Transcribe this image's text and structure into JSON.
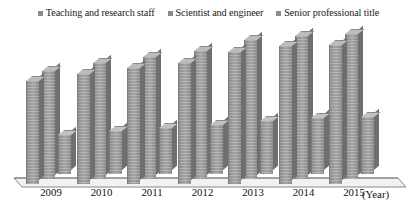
{
  "chart_data": {
    "type": "bar",
    "title": "",
    "subtitle": "",
    "xlabel": "(Year)",
    "ylabel": "",
    "categories": [
      "2009",
      "2010",
      "2011",
      "2012",
      "2013",
      "2014",
      "2015"
    ],
    "series": [
      {
        "name": "Teaching and research staff",
        "color": "#a6a6a6",
        "values": [
          112,
          120,
          126,
          132,
          144,
          150,
          152
        ]
      },
      {
        "name": "Scientist and engineer",
        "color": "#a6a6a6",
        "values": [
          118,
          126,
          133,
          139,
          151,
          156,
          158
        ]
      },
      {
        "name": "Senior professional title",
        "color": "#b3b3b3",
        "values": [
          42,
          47,
          50,
          53,
          58,
          61,
          62
        ]
      }
    ],
    "ylim": [
      0,
      170
    ],
    "grid": false,
    "legend_position": "top",
    "style": "3d-clustered-column"
  },
  "legend": {
    "items": [
      {
        "label": "Teaching and research staff",
        "swatch_color": "#8c8c8c"
      },
      {
        "label": "Scientist and engineer",
        "swatch_color": "#8c8c8c"
      },
      {
        "label": "Senior professional title",
        "swatch_color": "#8c8c8c"
      }
    ]
  },
  "axis": {
    "unit_label": "(Year)",
    "ticks": [
      "2009",
      "2010",
      "2011",
      "2012",
      "2013",
      "2014",
      "2015"
    ]
  },
  "colors": {
    "bar_face": "#a6a6a6",
    "bar_top": "#b9b9b9",
    "bar_side": "#6f6f6f",
    "axis_line": "#7a7a7a",
    "text": "#111111",
    "background": "#ffffff"
  }
}
